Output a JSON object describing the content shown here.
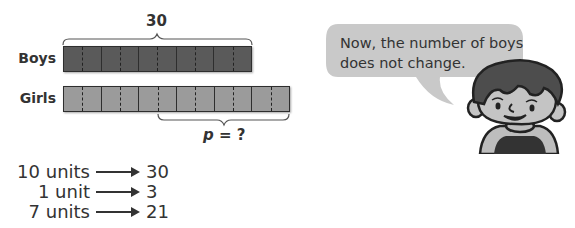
{
  "diagram": {
    "top_brace_label": "30",
    "bottom_brace_label_var": "p",
    "bottom_brace_label_rest": " = ?",
    "rows": [
      {
        "label": "Boys",
        "blocks": 5,
        "units": 10,
        "color": "#5a5a5a"
      },
      {
        "label": "Girls",
        "blocks": 6,
        "units": 12,
        "color": "#9b9b9b"
      }
    ]
  },
  "calculations": [
    {
      "left": "10 units",
      "right": "30"
    },
    {
      "left": "1 unit",
      "right": "3"
    },
    {
      "left": "7 units",
      "right": "21"
    }
  ],
  "speech_bubble": {
    "line1": "Now, the number of boys",
    "line2": "does not change."
  },
  "colors": {
    "boys_bar": "#5a5a5a",
    "girls_bar": "#9b9b9b",
    "bubble": "#c9c9c9"
  }
}
